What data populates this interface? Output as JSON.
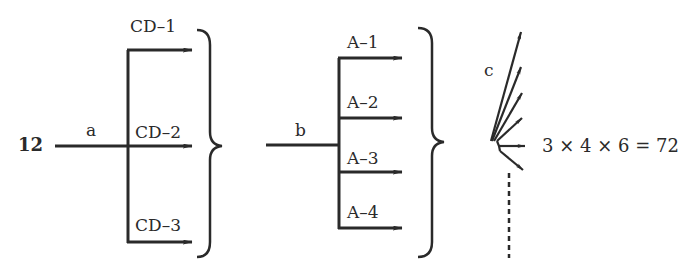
{
  "diagram": {
    "stage1": {
      "input_value": "12",
      "input_label": "a",
      "outputs": [
        "CD–1",
        "CD–2",
        "CD–3"
      ]
    },
    "stage2": {
      "input_label": "b",
      "outputs": [
        "A–1",
        "A–2",
        "A–3",
        "A–4"
      ]
    },
    "stage3": {
      "input_label": "c",
      "arrow_count": 6,
      "equation": "3 × 4 × 6 = 72"
    },
    "colors": {
      "ink": "#2a2a2a",
      "background": "#ffffff"
    }
  }
}
